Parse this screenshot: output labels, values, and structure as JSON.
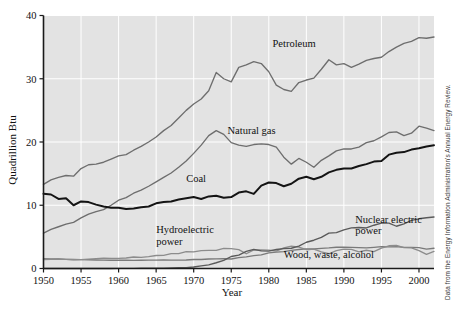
{
  "figure": {
    "source_note": "Data from the Energy Information Administration's Annual Energy Review.",
    "background_color": "#e3e3e3",
    "grid_color": "#ffffff"
  },
  "chart_data": {
    "type": "line",
    "title": "",
    "xlabel": "Year",
    "ylabel": "Quadrillion Btu",
    "xlim": [
      1950,
      2002
    ],
    "ylim": [
      0,
      40
    ],
    "xticks": [
      1950,
      1955,
      1960,
      1965,
      1970,
      1975,
      1980,
      1985,
      1990,
      1995,
      2000
    ],
    "yticks": [
      0,
      10,
      20,
      30,
      40
    ],
    "grid": true,
    "legend": "inline-labels",
    "x": [
      1950,
      1951,
      1952,
      1953,
      1954,
      1955,
      1956,
      1957,
      1958,
      1959,
      1960,
      1961,
      1962,
      1963,
      1964,
      1965,
      1966,
      1967,
      1968,
      1969,
      1970,
      1971,
      1972,
      1973,
      1974,
      1975,
      1976,
      1977,
      1978,
      1979,
      1980,
      1981,
      1982,
      1983,
      1984,
      1985,
      1986,
      1987,
      1988,
      1989,
      1990,
      1991,
      1992,
      1993,
      1994,
      1995,
      1996,
      1997,
      1998,
      1999,
      2000,
      2001,
      2002
    ],
    "series": [
      {
        "name": "Petroleum",
        "color": "#6e6e6e",
        "label": "Petroleum",
        "label_x": 1980.5,
        "label_y": 35.0,
        "values": [
          13.3,
          14.0,
          14.4,
          14.7,
          14.6,
          15.8,
          16.4,
          16.5,
          16.8,
          17.3,
          17.8,
          18.0,
          18.7,
          19.3,
          20.0,
          20.8,
          21.8,
          22.6,
          23.8,
          25.0,
          26.0,
          26.8,
          28.1,
          31.0,
          30.0,
          29.5,
          31.8,
          32.2,
          32.7,
          32.4,
          31.1,
          29.0,
          28.3,
          28.0,
          29.4,
          29.8,
          30.1,
          31.5,
          33.0,
          32.2,
          32.4,
          31.8,
          32.3,
          32.9,
          33.2,
          33.4,
          34.3,
          35.0,
          35.6,
          35.9,
          36.5,
          36.4,
          36.6
        ]
      },
      {
        "name": "Natural gas",
        "color": "#6e6e6e",
        "label": "Natural gas",
        "label_x": 1974.5,
        "label_y": 21.2,
        "values": [
          5.6,
          6.2,
          6.6,
          7.0,
          7.3,
          8.0,
          8.6,
          9.0,
          9.3,
          10.0,
          10.8,
          11.2,
          11.9,
          12.4,
          13.0,
          13.7,
          14.4,
          15.1,
          16.0,
          17.0,
          18.2,
          19.5,
          21.0,
          21.8,
          21.2,
          19.9,
          19.5,
          19.3,
          19.6,
          19.7,
          19.6,
          19.2,
          17.6,
          16.5,
          17.4,
          16.8,
          16.0,
          17.1,
          17.8,
          18.6,
          18.9,
          18.9,
          19.2,
          19.9,
          20.2,
          20.8,
          21.5,
          21.6,
          21.0,
          21.4,
          22.5,
          22.2,
          21.8
        ]
      },
      {
        "name": "Coal",
        "color": "#141414",
        "label": "Coal",
        "label_x": 1969.0,
        "label_y": 13.7,
        "values": [
          11.8,
          11.7,
          11.0,
          11.1,
          10.0,
          10.6,
          10.5,
          10.1,
          9.8,
          9.6,
          9.6,
          9.4,
          9.5,
          9.7,
          9.8,
          10.3,
          10.5,
          10.6,
          10.9,
          11.1,
          11.3,
          11.0,
          11.4,
          11.5,
          11.2,
          11.3,
          12.0,
          12.2,
          11.8,
          13.1,
          13.6,
          13.5,
          13.0,
          13.4,
          14.2,
          14.5,
          14.1,
          14.5,
          15.2,
          15.6,
          15.8,
          15.8,
          16.2,
          16.5,
          16.9,
          17.0,
          18.0,
          18.3,
          18.4,
          18.8,
          19.0,
          19.3,
          19.5
        ]
      },
      {
        "name": "Nuclear electric power",
        "color": "#5a5a5a",
        "label_line1": "Nuclear electric",
        "label_line2": "power",
        "label_x": 1991.5,
        "label_y": 7.2,
        "values": [
          0,
          0,
          0,
          0,
          0,
          0,
          0,
          0,
          0,
          0,
          0.01,
          0.02,
          0.03,
          0.04,
          0.04,
          0.04,
          0.06,
          0.09,
          0.14,
          0.15,
          0.24,
          0.41,
          0.58,
          0.91,
          1.27,
          1.9,
          2.11,
          2.7,
          3.02,
          2.78,
          2.74,
          3.01,
          3.13,
          3.2,
          3.55,
          4.15,
          4.47,
          4.91,
          5.59,
          5.68,
          6.1,
          6.42,
          6.48,
          6.41,
          6.84,
          7.18,
          7.17,
          6.68,
          7.07,
          7.61,
          7.86,
          8.03,
          8.14
        ]
      },
      {
        "name": "Hydroelectric power",
        "color": "#8c8c8c",
        "label_line1": "Hydroelectric",
        "label_line2": "power",
        "label_x": 1965.0,
        "label_y": 5.6,
        "values": [
          1.42,
          1.45,
          1.5,
          1.44,
          1.39,
          1.4,
          1.49,
          1.56,
          1.63,
          1.59,
          1.61,
          1.66,
          1.82,
          1.77,
          1.89,
          2.06,
          2.07,
          2.35,
          2.34,
          2.66,
          2.63,
          2.82,
          2.86,
          2.86,
          3.18,
          3.15,
          2.98,
          2.33,
          2.94,
          2.93,
          2.9,
          2.76,
          3.27,
          3.53,
          3.39,
          2.97,
          3.07,
          2.63,
          2.33,
          2.84,
          3.05,
          3.02,
          2.62,
          2.89,
          2.68,
          3.21,
          3.59,
          3.64,
          3.3,
          3.27,
          2.81,
          2.24,
          2.69
        ]
      },
      {
        "name": "Wood, waste, alcohol",
        "color": "#7a7a7a",
        "label": "Wood, waste, alcohol",
        "label_x": 1982.0,
        "label_y": 1.6,
        "values": [
          1.56,
          1.53,
          1.5,
          1.45,
          1.42,
          1.4,
          1.38,
          1.35,
          1.32,
          1.3,
          1.32,
          1.3,
          1.28,
          1.3,
          1.32,
          1.33,
          1.35,
          1.33,
          1.32,
          1.35,
          1.43,
          1.43,
          1.5,
          1.53,
          1.54,
          1.5,
          1.71,
          1.84,
          2.04,
          2.15,
          2.48,
          2.59,
          2.66,
          2.87,
          3.01,
          3.1,
          3.08,
          3.18,
          3.25,
          3.36,
          3.38,
          3.34,
          3.31,
          3.25,
          3.35,
          3.46,
          3.42,
          3.46,
          3.33,
          3.35,
          3.31,
          3.06,
          3.2
        ]
      }
    ]
  }
}
